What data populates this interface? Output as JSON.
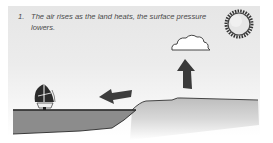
{
  "diagram": {
    "step_number": "1.",
    "caption": "The air rises as the land heats, the surface pressure lowers.",
    "elements": [
      "sun-icon",
      "cloud-icon",
      "rising-air-arrow-icon",
      "wind-arrow-icon",
      "sailboat-icon",
      "water",
      "land"
    ],
    "colors": {
      "sky": "#e8e8e8",
      "water": "#8c8c8c",
      "arrow": "#3a3a3a",
      "outline": "#2a2a2a"
    }
  }
}
